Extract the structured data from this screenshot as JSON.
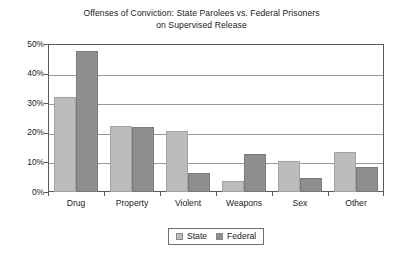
{
  "chart_data": {
    "type": "bar",
    "title": "Offenses of Conviction: State Parolees vs. Federal Prisoners on Supervised Release",
    "title_line1": "Offenses of Conviction: State Parolees vs. Federal Prisoners",
    "title_line2": "on Supervised Release",
    "xlabel": "",
    "ylabel": "",
    "categories": [
      "Drug",
      "Property",
      "Violent",
      "Weapons",
      "Sex",
      "Other"
    ],
    "series": [
      {
        "name": "State",
        "color": "#bcbcbc",
        "values": [
          32.0,
          22.2,
          20.5,
          3.7,
          10.5,
          13.5
        ]
      },
      {
        "name": "Federal",
        "color": "#8e8e8e",
        "values": [
          47.8,
          21.8,
          6.3,
          12.7,
          4.8,
          8.5
        ]
      }
    ],
    "ylim": [
      0,
      50
    ],
    "ytick_values": [
      0,
      10,
      20,
      30,
      40,
      50
    ],
    "ytick_labels": [
      "0%",
      "10%",
      "20%",
      "30%",
      "40%",
      "50%"
    ],
    "grid": true,
    "grid_axis": "y",
    "legend_position": "bottom-center",
    "value_suffix": "%"
  },
  "legend": {
    "entries": [
      {
        "label": "State",
        "color": "#bcbcbc"
      },
      {
        "label": "Federal",
        "color": "#8e8e8e"
      }
    ]
  },
  "colors": {
    "state": "#bcbcbc",
    "federal": "#8e8e8e",
    "grid": "#9a9a9a",
    "axis": "#5a5a5a",
    "text": "#1a1a1a",
    "background": "#ffffff"
  }
}
